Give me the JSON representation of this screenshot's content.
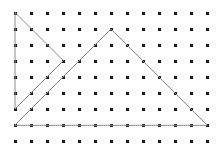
{
  "figure": {
    "background_color": "#ffffff",
    "width": 223,
    "height": 144
  },
  "lattice": {
    "name": "dot-grid",
    "columns": 13,
    "rows": 9,
    "spacing_px": 16,
    "origin_x": 15,
    "origin_y": 13,
    "dot_size_px": 3,
    "dot_color": "#1a1a1a",
    "total_dots": 117
  },
  "chart_data": {
    "type": "scatter",
    "xlabel": "",
    "ylabel": "",
    "grid": true,
    "legend": "none",
    "xlim": [
      0,
      12
    ],
    "ylim": [
      0,
      8
    ],
    "categories": [],
    "values": [],
    "lattice_points": {
      "x_indices": [
        0,
        1,
        2,
        3,
        4,
        5,
        6,
        7,
        8,
        9,
        10,
        11,
        12
      ],
      "y_indices": [
        0,
        1,
        2,
        3,
        4,
        5,
        6,
        7,
        8
      ]
    },
    "series": [
      {
        "name": "small-triangle",
        "closed": true,
        "grid_vertices": [
          [
            0,
            0
          ],
          [
            0,
            6
          ],
          [
            3,
            3
          ]
        ],
        "pixel_vertices": [
          [
            15,
            13
          ],
          [
            15,
            109
          ],
          [
            63,
            61
          ]
        ],
        "stroke": "#8c8c8c"
      },
      {
        "name": "large-triangle",
        "closed": true,
        "grid_vertices": [
          [
            0,
            7
          ],
          [
            6,
            1
          ],
          [
            12,
            7
          ]
        ],
        "pixel_vertices": [
          [
            15,
            125
          ],
          [
            111,
            29
          ],
          [
            207,
            125
          ]
        ],
        "stroke": "#8c8c8c"
      }
    ]
  },
  "shapes": {
    "stroke_color": "#8c8c8c",
    "stroke_width": 1,
    "small_triangle": {
      "label": "small-triangle",
      "points": "15,13 15,109 63,61"
    },
    "large_triangle": {
      "label": "large-triangle",
      "points": "15,125 111,29 207,125"
    }
  }
}
